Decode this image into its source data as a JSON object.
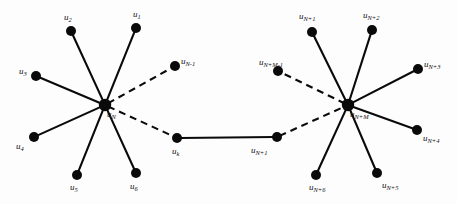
{
  "figure": {
    "width": 457,
    "height": 204,
    "background_color": "#fdfdfd",
    "stroke_color": "#0a0a0a",
    "node_color": "#0a0a0a"
  },
  "nodes": [
    {
      "id": "u2",
      "base": "u",
      "sub": "2",
      "cx": 71,
      "cy": 31,
      "r": 5.0,
      "label_x": 64,
      "label_y": 13,
      "cluster": "left"
    },
    {
      "id": "u1",
      "base": "u",
      "sub": "1",
      "cx": 136,
      "cy": 28,
      "r": 5.0,
      "label_x": 133,
      "label_y": 10,
      "cluster": "left"
    },
    {
      "id": "u3",
      "base": "u",
      "sub": "3",
      "cx": 36,
      "cy": 76,
      "r": 5.0,
      "label_x": 19,
      "label_y": 67,
      "cluster": "left"
    },
    {
      "id": "u4",
      "base": "u",
      "sub": "4",
      "cx": 34,
      "cy": 137,
      "r": 5.0,
      "label_x": 16,
      "label_y": 142,
      "cluster": "left"
    },
    {
      "id": "u5",
      "base": "u",
      "sub": "5",
      "cx": 77,
      "cy": 175,
      "r": 5.0,
      "label_x": 70,
      "label_y": 183,
      "cluster": "left"
    },
    {
      "id": "u6",
      "base": "u",
      "sub": "6",
      "cx": 136,
      "cy": 173,
      "r": 5.0,
      "label_x": 130,
      "label_y": 182,
      "cluster": "left"
    },
    {
      "id": "uN",
      "base": "u",
      "sub": "N",
      "cx": 105,
      "cy": 105,
      "r": 6.2,
      "label_x": 107,
      "label_y": 110,
      "cluster": "left"
    },
    {
      "id": "uNm1",
      "base": "u",
      "sub": "N-1",
      "cx": 175,
      "cy": 66,
      "r": 5.0,
      "label_x": 181,
      "label_y": 57,
      "cluster": "bridge"
    },
    {
      "id": "uk",
      "base": "u",
      "sub": "k",
      "cx": 177,
      "cy": 138,
      "r": 5.0,
      "label_x": 172,
      "label_y": 147,
      "cluster": "bridge"
    },
    {
      "id": "uNp1b",
      "base": "u",
      "sub": "N+1",
      "cx": 277,
      "cy": 137,
      "r": 5.0,
      "label_x": 251,
      "label_y": 146,
      "cluster": "bridge"
    },
    {
      "id": "uNpMm1",
      "base": "u",
      "sub": "N+M-1",
      "cx": 278,
      "cy": 71,
      "r": 5.0,
      "label_x": 259,
      "label_y": 58,
      "cluster": "bridge"
    },
    {
      "id": "uNp1",
      "base": "u",
      "sub": "N+1",
      "cx": 312,
      "cy": 32,
      "r": 5.0,
      "label_x": 299,
      "label_y": 12,
      "cluster": "right"
    },
    {
      "id": "uNp2",
      "base": "u",
      "sub": "N+2",
      "cx": 372,
      "cy": 30,
      "r": 5.0,
      "label_x": 363,
      "label_y": 11,
      "cluster": "right"
    },
    {
      "id": "uNp3",
      "base": "u",
      "sub": "N+3",
      "cx": 418,
      "cy": 69,
      "r": 5.0,
      "label_x": 424,
      "label_y": 60,
      "cluster": "right"
    },
    {
      "id": "uNp4",
      "base": "u",
      "sub": "N+4",
      "cx": 417,
      "cy": 130,
      "r": 5.0,
      "label_x": 423,
      "label_y": 134,
      "cluster": "right"
    },
    {
      "id": "uNp5",
      "base": "u",
      "sub": "N+5",
      "cx": 377,
      "cy": 173,
      "r": 5.0,
      "label_x": 382,
      "label_y": 181,
      "cluster": "right"
    },
    {
      "id": "uNp6",
      "base": "u",
      "sub": "N+6",
      "cx": 316,
      "cy": 175,
      "r": 5.0,
      "label_x": 309,
      "label_y": 183,
      "cluster": "right"
    },
    {
      "id": "uNpM",
      "base": "u",
      "sub": "N+M",
      "cx": 348,
      "cy": 105,
      "r": 6.2,
      "label_x": 350,
      "label_y": 110,
      "cluster": "right"
    }
  ],
  "edges": [
    {
      "from": "uN",
      "to": "u2",
      "style": "solid"
    },
    {
      "from": "uN",
      "to": "u1",
      "style": "solid"
    },
    {
      "from": "uN",
      "to": "u3",
      "style": "solid"
    },
    {
      "from": "uN",
      "to": "u4",
      "style": "solid"
    },
    {
      "from": "uN",
      "to": "u5",
      "style": "solid"
    },
    {
      "from": "uN",
      "to": "u6",
      "style": "solid"
    },
    {
      "from": "uN",
      "to": "uNm1",
      "style": "dashed"
    },
    {
      "from": "uN",
      "to": "uk",
      "style": "dashed"
    },
    {
      "from": "uk",
      "to": "uNp1b",
      "style": "solid"
    },
    {
      "from": "uNp1b",
      "to": "uNpM",
      "style": "dashed"
    },
    {
      "from": "uNpM",
      "to": "uNpMm1",
      "style": "dashed"
    },
    {
      "from": "uNpM",
      "to": "uNp1",
      "style": "solid"
    },
    {
      "from": "uNpM",
      "to": "uNp2",
      "style": "solid"
    },
    {
      "from": "uNpM",
      "to": "uNp3",
      "style": "solid"
    },
    {
      "from": "uNpM",
      "to": "uNp4",
      "style": "solid"
    },
    {
      "from": "uNpM",
      "to": "uNp5",
      "style": "solid"
    },
    {
      "from": "uNpM",
      "to": "uNp6",
      "style": "solid"
    }
  ]
}
